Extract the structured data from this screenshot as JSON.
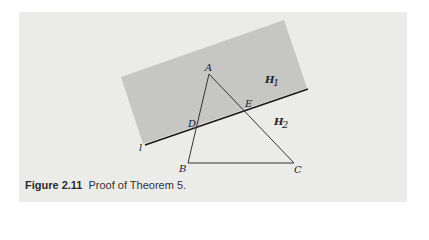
{
  "figure": {
    "number": "Figure 2.11",
    "caption": "Proof of Theorem 5.",
    "colors": {
      "panel_background": "#ebebea",
      "half_plane_shade": "#c6c6c5",
      "line_color": "#1a1a1a",
      "triangle_color": "#333333"
    },
    "labels": {
      "A": "A",
      "B": "B",
      "C": "C",
      "D": "D",
      "E": "E",
      "l": "l",
      "H1": "H",
      "H1_sub": "1",
      "H2": "H",
      "H2_sub": "2"
    }
  }
}
